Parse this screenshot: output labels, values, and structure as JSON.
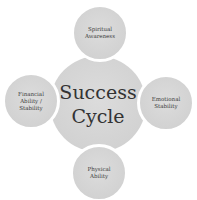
{
  "diagram": {
    "type": "cycle",
    "center": {
      "line1": "Success",
      "line2": "Cycle"
    },
    "nodes": [
      {
        "position": "top",
        "line1": "Spiritual",
        "line2": "Awareness",
        "line3": ""
      },
      {
        "position": "right",
        "line1": "Emotional",
        "line2": "Stability",
        "line3": ""
      },
      {
        "position": "bottom",
        "line1": "Physical",
        "line2": "Ability",
        "line3": ""
      },
      {
        "position": "left",
        "line1": "Financial",
        "line2": "Ability /",
        "line3": "Stability"
      }
    ],
    "colors": {
      "fill": "#d3d3d3",
      "text": "#333333",
      "border": "#ffffff",
      "background": "#ffffff"
    }
  }
}
